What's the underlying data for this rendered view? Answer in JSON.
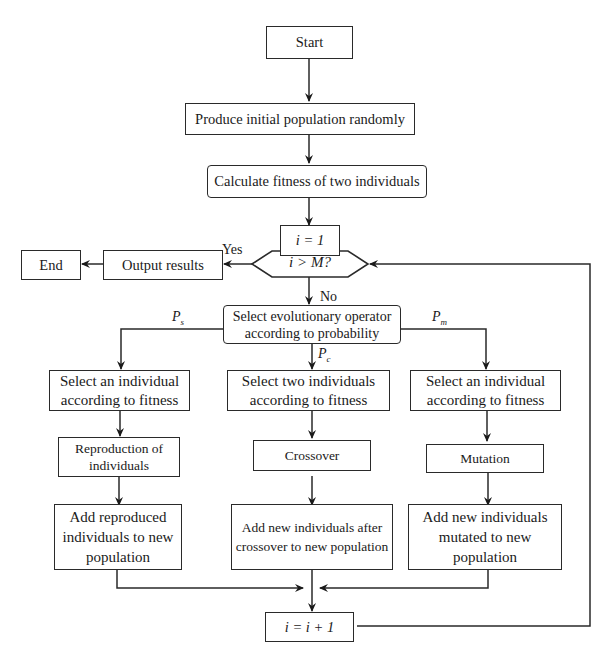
{
  "flowchart": {
    "start": "Start",
    "init_population": "Produce initial population randomly",
    "calc_fitness": "Calculate fitness of two individuals",
    "init_counter": "i = 1",
    "decision": "i > M?",
    "yes_label": "Yes",
    "no_label": "No",
    "output_results": "Output results",
    "end": "End",
    "select_operator": "Select evolutionary operator according to probability",
    "prob_labels": {
      "left": "P",
      "left_sub": "s",
      "middle": "P",
      "middle_sub": "c",
      "right": "P",
      "right_sub": "m"
    },
    "branches": [
      {
        "select": "Select an individual according to fitness",
        "operation": "Reproduction of individuals",
        "add": "Add reproduced individuals to new population"
      },
      {
        "select": "Select two individuals according to fitness",
        "operation": "Crossover",
        "add": "Add new individuals after crossover to new population"
      },
      {
        "select": "Select an individual according to fitness",
        "operation": "Mutation",
        "add": "Add new individuals mutated to new population"
      }
    ],
    "increment": "i = i + 1"
  }
}
